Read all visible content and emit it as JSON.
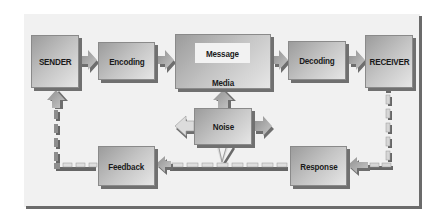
{
  "diagram": {
    "colors": {
      "panel_bg": "#f1f1f1",
      "panel_border": "#6b6b6b",
      "box_gradient_start": "#9c9c9c",
      "box_gradient_end": "#e6e6e6",
      "box_shadow": "#707070",
      "inner_box": "#f2f2f2",
      "text": "#1a1a1a"
    },
    "nodes": {
      "sender": {
        "label": "SENDER"
      },
      "encoding": {
        "label": "Encoding"
      },
      "message": {
        "label": "Message"
      },
      "media": {
        "label": "Media"
      },
      "decoding": {
        "label": "Decoding"
      },
      "receiver": {
        "label": "RECEIVER"
      },
      "noise": {
        "label": "Noise"
      },
      "feedback": {
        "label": "Feedback"
      },
      "response": {
        "label": "Response"
      }
    },
    "edges": [
      {
        "from": "SENDER",
        "to": "Encoding",
        "style": "solid-arrow"
      },
      {
        "from": "Encoding",
        "to": "Message/Media",
        "style": "solid-arrow"
      },
      {
        "from": "Message/Media",
        "to": "Decoding",
        "style": "solid-arrow"
      },
      {
        "from": "Decoding",
        "to": "RECEIVER",
        "style": "solid-arrow"
      },
      {
        "from": "Noise",
        "to": "Message/Media",
        "style": "solid-arrow"
      },
      {
        "from": "Noise",
        "to": "left",
        "style": "solid-arrow"
      },
      {
        "from": "Noise",
        "to": "right",
        "style": "solid-arrow"
      },
      {
        "from": "Noise",
        "to": "feedback-loop",
        "style": "thin-arrow"
      },
      {
        "from": "RECEIVER",
        "to": "Response",
        "style": "dashed-arrow"
      },
      {
        "from": "Response",
        "to": "Feedback",
        "style": "dashed-arrow"
      },
      {
        "from": "Feedback",
        "to": "SENDER",
        "style": "dashed-arrow"
      }
    ]
  }
}
